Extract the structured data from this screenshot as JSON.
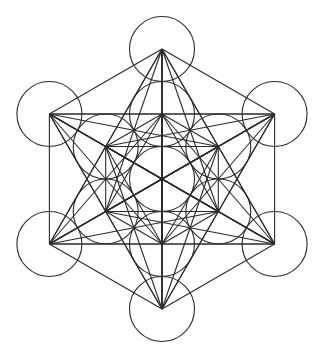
{
  "diagram": {
    "center": [
      162,
      179
    ],
    "inner_ring_radius": 65,
    "outer_ring_radius": 130,
    "circle_radius": 32.5,
    "stroke_color": "#2b2b2b",
    "background_color": "#ffffff",
    "nodes": [
      {
        "name": "center",
        "pos": [
          162,
          179
        ]
      },
      {
        "name": "inner-top",
        "pos": [
          162,
          114
        ]
      },
      {
        "name": "inner-upper-right",
        "pos": [
          218.3,
          146.5
        ]
      },
      {
        "name": "inner-lower-right",
        "pos": [
          218.3,
          211.5
        ]
      },
      {
        "name": "inner-bottom",
        "pos": [
          162,
          244
        ]
      },
      {
        "name": "inner-lower-left",
        "pos": [
          105.7,
          211.5
        ]
      },
      {
        "name": "inner-upper-left",
        "pos": [
          105.7,
          146.5
        ]
      },
      {
        "name": "outer-top",
        "pos": [
          162,
          49
        ]
      },
      {
        "name": "outer-upper-right",
        "pos": [
          274.6,
          114
        ]
      },
      {
        "name": "outer-lower-right",
        "pos": [
          274.6,
          244
        ]
      },
      {
        "name": "outer-bottom",
        "pos": [
          162,
          309
        ]
      },
      {
        "name": "outer-lower-left",
        "pos": [
          49.4,
          244
        ]
      },
      {
        "name": "outer-upper-left",
        "pos": [
          49.4,
          114
        ]
      }
    ],
    "connect_all_nodes": true
  }
}
